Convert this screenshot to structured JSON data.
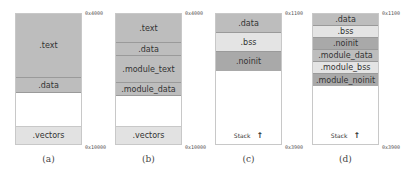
{
  "colors": {
    "code": "#bdbdbd",
    "bss": "#e4e4e4",
    "noinit": "#a9a9a9",
    "vectors": "#e2e2e2",
    "empty": "#ffffff"
  },
  "panels": [
    {
      "caption": "(a)",
      "addr_top": "0x4000",
      "addr_bottom": "0x10000",
      "segments": [
        {
          "label": ".text",
          "top": 0,
          "height": 64,
          "color": "#bdbdbd"
        },
        {
          "label": ".data",
          "top": 64,
          "height": 15,
          "color": "#bdbdbd"
        },
        {
          "label": ".vectors",
          "top": 113,
          "height": 19,
          "color": "#e2e2e2"
        }
      ]
    },
    {
      "caption": "(b)",
      "addr_top": "0x4000",
      "addr_bottom": "0x10000",
      "segments": [
        {
          "label": ".text",
          "top": 0,
          "height": 29,
          "color": "#bdbdbd"
        },
        {
          "label": ".data",
          "top": 29,
          "height": 13,
          "color": "#bdbdbd"
        },
        {
          "label": ".module_text",
          "top": 42,
          "height": 27,
          "color": "#bdbdbd"
        },
        {
          "label": ".module_data",
          "top": 69,
          "height": 13,
          "color": "#bdbdbd"
        },
        {
          "label": ".vectors",
          "top": 113,
          "height": 19,
          "color": "#e2e2e2"
        }
      ]
    },
    {
      "caption": "(c)",
      "addr_top": "0x1100",
      "addr_bottom": "0x3900",
      "stack_label": "Stack",
      "stack_arrow": "🠕",
      "segments": [
        {
          "label": ".data",
          "top": 0,
          "height": 19,
          "color": "#bdbdbd"
        },
        {
          "label": ".bss",
          "top": 19,
          "height": 19,
          "color": "#e4e4e4"
        },
        {
          "label": ".noinit",
          "top": 38,
          "height": 19,
          "color": "#a9a9a9"
        }
      ]
    },
    {
      "caption": "(d)",
      "addr_top": "0x1100",
      "addr_bottom": "0x3900",
      "stack_label": "Stack",
      "stack_arrow": "🠕",
      "segments": [
        {
          "label": ".data",
          "top": 0,
          "height": 12,
          "color": "#bdbdbd"
        },
        {
          "label": ".bss",
          "top": 12,
          "height": 12,
          "color": "#e4e4e4"
        },
        {
          "label": ".noinit",
          "top": 24,
          "height": 12,
          "color": "#a9a9a9"
        },
        {
          "label": ".module_data",
          "top": 36,
          "height": 12,
          "color": "#bdbdbd"
        },
        {
          "label": ".module_bss",
          "top": 48,
          "height": 12,
          "color": "#e4e4e4"
        },
        {
          "label": ".module_noinit",
          "top": 60,
          "height": 12,
          "color": "#a9a9a9"
        }
      ]
    }
  ]
}
